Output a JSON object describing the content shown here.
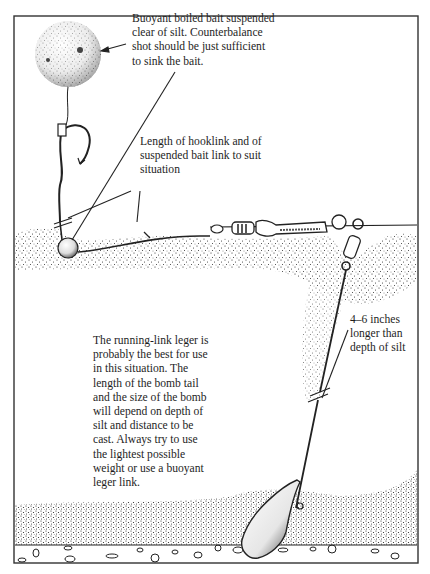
{
  "diagram": {
    "annotations": {
      "bait": "Buoyant boiled bait suspended\nclear of silt. Counterbalance\nshot should be just sufficient\nto sink the bait.",
      "hooklink": "Length of hooklink and of\nsuspended bait link to suit\nsituation",
      "bomb_tail": "4–6 inches\nlonger than\ndepth of silt",
      "main_note": "The running-link leger is\nprobably the best for use\nin this situation. The\nlength of the bomb tail\nand the size of the bomb\nwill depend on depth of\nsilt and distance to be\ncast. Always try to use\nthe lightest possible\nweight or use a buoyant\nleger link."
    },
    "components": [
      "buoyant-boilie",
      "hook",
      "counterbalance-shot",
      "hooklink",
      "swivel",
      "leger-tube",
      "bead",
      "running-link-swivel",
      "bomb-tail",
      "bomb-weight",
      "silt-layer",
      "gravel-lakebed"
    ],
    "colors": {
      "ink": "#1a1a1a",
      "paper": "#ffffff"
    }
  }
}
